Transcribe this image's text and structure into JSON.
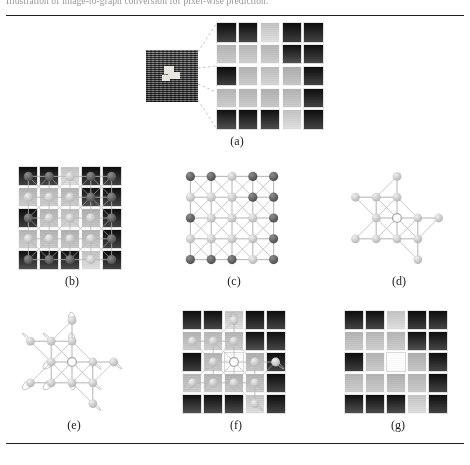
{
  "document": {
    "top_caption": "Illustration of image-to-graph conversion for pixel-wise prediction.",
    "rules": {
      "top": true,
      "bottom": true
    }
  },
  "figure": {
    "panels": [
      {
        "id": "a",
        "caption": "(a)",
        "kind": "zoom-callout",
        "description": "Source texture image with a 5x5 pixel patch magnified"
      },
      {
        "id": "b",
        "caption": "(b)",
        "kind": "grid-with-graph",
        "description": "Graph overlaid on the magnified pixel patch"
      },
      {
        "id": "c",
        "caption": "(c)",
        "kind": "graph",
        "description": "Full 5x5 lattice graph with 8-connected edges"
      },
      {
        "id": "d",
        "caption": "(d)",
        "kind": "graph",
        "description": "Sparsified subgraph after edge pruning"
      },
      {
        "id": "e",
        "caption": "(e)",
        "kind": "graph-selfloops",
        "description": "Subgraph with self-loops and a hollow query node"
      },
      {
        "id": "f",
        "caption": "(f)",
        "kind": "grid-with-graph",
        "description": "Subgraph re-projected onto the pixel patch"
      },
      {
        "id": "g",
        "caption": "(g)",
        "kind": "grid",
        "description": "Predicted patch with the centre pixel filled white"
      }
    ]
  },
  "pixel_patch": {
    "rows": 5,
    "cols": 5,
    "note": "Mean grey level of each cell, 0 = black .. 255 = white",
    "values": [
      [
        44,
        46,
        214,
        40,
        44
      ],
      [
        196,
        200,
        198,
        52,
        46
      ],
      [
        40,
        196,
        206,
        190,
        44
      ],
      [
        198,
        196,
        192,
        196,
        44
      ],
      [
        52,
        48,
        50,
        214,
        44
      ]
    ]
  },
  "predicted_patch": {
    "rows": 5,
    "cols": 5,
    "centre": {
      "row": 2,
      "col": 2,
      "value": 255,
      "label": "white"
    },
    "values": [
      [
        44,
        46,
        214,
        40,
        44
      ],
      [
        196,
        200,
        198,
        52,
        46
      ],
      [
        40,
        196,
        255,
        190,
        44
      ],
      [
        198,
        196,
        192,
        196,
        44
      ],
      [
        52,
        48,
        50,
        214,
        44
      ]
    ]
  },
  "lattice_graph": {
    "rows": 5,
    "cols": 5,
    "node_count": 25,
    "connectivity": "8-neighbour (horizontal, vertical, diagonal)",
    "node_shades": [
      [
        "#6a6a6a",
        "#6a6a6a",
        "#c9c9c9",
        "#5f5f5f",
        "#5f5f5f"
      ],
      [
        "#bdbdbd",
        "#c2c2c2",
        "#c2c2c2",
        "#6a6a6a",
        "#636363"
      ],
      [
        "#5f5f5f",
        "#bdbdbd",
        "#c7c7c7",
        "#bdbdbd",
        "#5f5f5f"
      ],
      [
        "#c2c2c2",
        "#bdbdbd",
        "#bdbdbd",
        "#bdbdbd",
        "#5f5f5f"
      ],
      [
        "#636363",
        "#636363",
        "#636363",
        "#c9c9c9",
        "#5f5f5f"
      ]
    ]
  },
  "subgraph": {
    "node_count": 13,
    "nodes": [
      {
        "id": "n0",
        "col": 2,
        "row": 0
      },
      {
        "id": "n1",
        "col": 0,
        "row": 1
      },
      {
        "id": "n2",
        "col": 1,
        "row": 1
      },
      {
        "id": "n3",
        "col": 2,
        "row": 1
      },
      {
        "id": "n4",
        "col": 1,
        "row": 2
      },
      {
        "id": "n5",
        "col": 2,
        "row": 2
      },
      {
        "id": "n6",
        "col": 3,
        "row": 2
      },
      {
        "id": "n7",
        "col": 0,
        "row": 3
      },
      {
        "id": "n8",
        "col": 1,
        "row": 3
      },
      {
        "id": "n9",
        "col": 2,
        "row": 3
      },
      {
        "id": "n10",
        "col": 3,
        "row": 3
      },
      {
        "id": "n11",
        "col": 3,
        "row": 4
      },
      {
        "id": "n12",
        "col": 4,
        "row": 2
      }
    ],
    "centre_node": "n5",
    "centre_style": "hollow"
  },
  "colors": {
    "rule": "#1f1f1f",
    "node_fill_light": "#c6c6c6",
    "node_fill_dark": "#5f5f5f",
    "edge": "#b6b6b6",
    "caption_text": "#1c1c1c",
    "hollow_node_stroke": "#a8a8a8",
    "projector_line": "#c4c4c4",
    "white_cell": "#ffffff"
  }
}
